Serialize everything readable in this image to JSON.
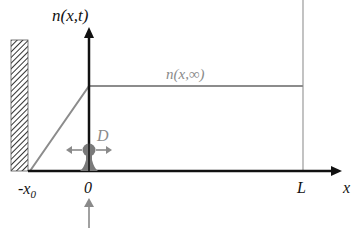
{
  "diagram": {
    "y_axis_label": "n(x,t)",
    "x_axis_label": "x",
    "steady_state_label": "n(x,∞)",
    "diffusion_label": "D",
    "tick_labels": {
      "wall": "-x",
      "wall_subscript": "0",
      "origin": "0",
      "length": "L"
    },
    "colors": {
      "axis": "#111111",
      "profile_line": "#8c8c8c",
      "boundary_line": "#9a9a9a",
      "source": "#7a7a7a",
      "gray_label": "#8a8a8a",
      "hatch": "#333333"
    }
  }
}
